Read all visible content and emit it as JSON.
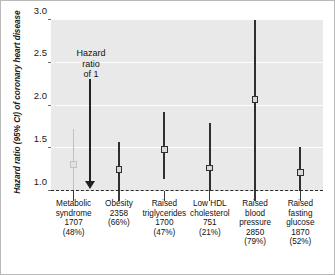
{
  "chart_data": {
    "type": "scatter",
    "title": "",
    "xlabel": "",
    "ylabel": "Hazard ratio (95% CI) of coronary heart disease",
    "ylim": [
      1.0,
      3.0
    ],
    "yticks": [
      "1.0",
      "1.5",
      "2.0",
      "2.5",
      "3.0"
    ],
    "grid": true,
    "legend": "none",
    "reference_line": {
      "value": 1.0,
      "style": "dashed"
    },
    "annotations": [
      {
        "text_lines": [
          "Hazard",
          "ratio",
          "of 1"
        ],
        "points_to": 1.0,
        "arrow": "down"
      }
    ],
    "categories": [
      "Metabolic syndrome 1707 (48%)",
      "Obesity 2358 (66%)",
      "Raised triglycerides 1700 (47%)",
      "Low HDL cholesterol 751 (21%)",
      "Raised blood pressure 2850 (79%)",
      "Raised fasting glucose 1870 (52%)"
    ],
    "points": [
      {
        "label_lines": [
          "Metabolic",
          "syndrome",
          "1707",
          "(48%)"
        ],
        "n": "1707",
        "percent": "(48%)",
        "hazard_ratio": 1.31,
        "ci_low": 1.0,
        "ci_high": 1.73,
        "highlight": "light"
      },
      {
        "label_lines": [
          "Obesity",
          "2358",
          "(66%)"
        ],
        "n": "2358",
        "percent": "(66%)",
        "hazard_ratio": 1.25,
        "ci_low": 0.99,
        "ci_high": 1.57,
        "highlight": "dark"
      },
      {
        "label_lines": [
          "Raised",
          "triglycerides",
          "1700",
          "(47%)"
        ],
        "n": "1700",
        "percent": "(47%)",
        "hazard_ratio": 1.49,
        "ci_low": 1.14,
        "ci_high": 1.92,
        "highlight": "dark"
      },
      {
        "label_lines": [
          "Low HDL",
          "cholesterol",
          "751",
          "(21%)"
        ],
        "n": "751",
        "percent": "(21%)",
        "hazard_ratio": 1.27,
        "ci_low": 0.92,
        "ci_high": 1.79,
        "highlight": "dark"
      },
      {
        "label_lines": [
          "Raised",
          "blood",
          "pressure",
          "2850",
          "(79%)"
        ],
        "n": "2850",
        "percent": "(79%)",
        "hazard_ratio": 2.07,
        "ci_low": 0.88,
        "ci_high": 3.0,
        "highlight": "dark"
      },
      {
        "label_lines": [
          "Raised",
          "fasting",
          "glucose",
          "1870",
          "(52%)"
        ],
        "n": "1870",
        "percent": "(52%)",
        "hazard_ratio": 1.22,
        "ci_low": 1.0,
        "ci_high": 1.51,
        "highlight": "dark"
      }
    ],
    "colors": {
      "plot_background": "#e9e9e9",
      "gridline": "#fdfdfd",
      "marker": "#2f2f2f",
      "marker_light": "#c3c3c3",
      "reference_line": "#2a2a2a",
      "text": "#111111",
      "frame": "#b9b9b9"
    }
  }
}
